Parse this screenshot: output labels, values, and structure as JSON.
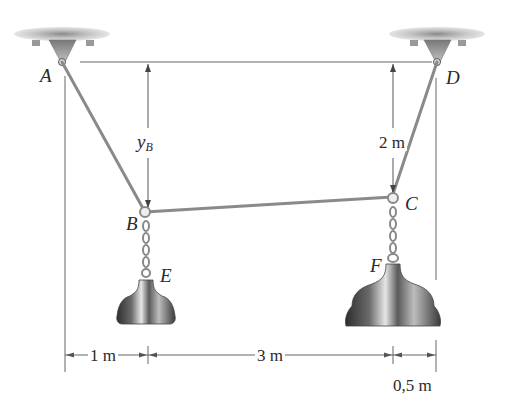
{
  "figure": {
    "type": "statics-cable-diagram",
    "points": {
      "A": {
        "label": "A"
      },
      "B": {
        "label": "B"
      },
      "C": {
        "label": "C"
      },
      "D": {
        "label": "D"
      },
      "E": {
        "label": "E"
      },
      "F": {
        "label": "F"
      }
    },
    "dimensions": {
      "yB": {
        "main": "y",
        "sub": "B"
      },
      "vertical_right": "2 m",
      "horizontal": [
        "1 m",
        "3 m",
        "0,5 m"
      ]
    },
    "colors": {
      "line": "#555555",
      "cable": "#8a8a8a",
      "support": "#9a9a9a",
      "weight_dark": "#3a3a3a",
      "weight_light": "#d8d8d8"
    }
  }
}
